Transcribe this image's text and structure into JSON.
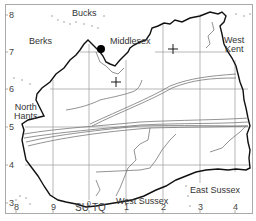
{
  "map": {
    "title": "",
    "regions": [
      {
        "id": "bucks",
        "label": "Bucks"
      },
      {
        "id": "berks",
        "label": "Berks"
      },
      {
        "id": "middlesex",
        "label": "Middlesex"
      },
      {
        "id": "west-kent",
        "label_line1": "West",
        "label_line2": "Kent"
      },
      {
        "id": "north-hants",
        "label_line1": "North",
        "label_line2": "Hants"
      },
      {
        "id": "west-sussex",
        "label": "West Sussex"
      },
      {
        "id": "east-sussex",
        "label": "East Sussex"
      }
    ],
    "y_ticks": [
      "8",
      "7",
      "6",
      "5",
      "4",
      "3"
    ],
    "x_ticks": [
      "8",
      "9",
      "0",
      "1",
      "2",
      "3",
      "4"
    ],
    "grid_squares": {
      "left": "SU",
      "right": "TQ"
    },
    "colors": {
      "boundary": "#111111",
      "grid": "#888888",
      "contours": "#777777",
      "frame": "#999999",
      "marker": "#000000"
    }
  }
}
